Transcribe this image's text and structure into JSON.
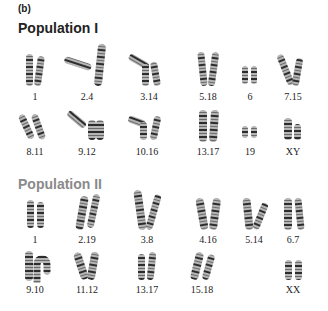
{
  "panel_label": "(b)",
  "populations": [
    {
      "title": "Population I",
      "title_color": "#222222",
      "rows": [
        [
          "1",
          "2.4",
          "3.14",
          "5.18",
          "6",
          "7.15"
        ],
        [
          "8.11",
          "9.12",
          "10.16",
          "13.17",
          "19",
          "XY"
        ]
      ]
    },
    {
      "title": "Population II",
      "title_color": "#8a8a8a",
      "rows": [
        [
          "1",
          "2.19",
          "3.8",
          "4.16",
          "5.14",
          "6.7"
        ],
        [
          "9.10",
          "11.12",
          "13.17",
          "15.18",
          "",
          "XX"
        ]
      ]
    }
  ]
}
